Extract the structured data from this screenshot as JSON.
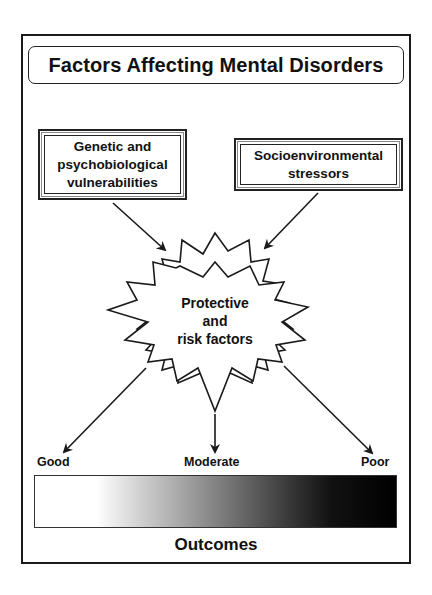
{
  "title": "Factors Affecting Mental Disorders",
  "inputs": {
    "genetic": {
      "lines": [
        "Genetic and",
        "psychobiological",
        "vulnerabilities"
      ]
    },
    "socio": {
      "lines": [
        "Socioenvironmental",
        "stressors"
      ]
    }
  },
  "center": {
    "lines": [
      "Protective",
      "and",
      "risk factors"
    ],
    "shape": "starburst"
  },
  "outcomes": {
    "labels": {
      "good": "Good",
      "moderate": "Moderate",
      "poor": "Poor"
    },
    "title": "Outcomes",
    "gradient": {
      "from": "#ffffff",
      "to": "#000000"
    }
  },
  "colors": {
    "line": "#1a1a1a",
    "background": "#ffffff"
  }
}
